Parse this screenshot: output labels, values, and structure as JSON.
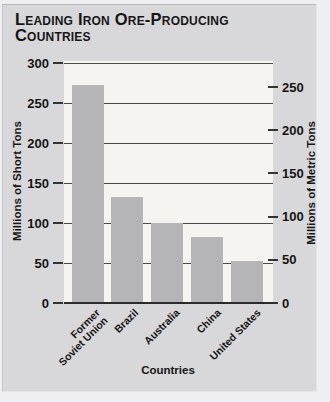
{
  "title": "Leading Iron Ore-Producing Countries",
  "chart_data": {
    "type": "bar",
    "title": "Leading Iron Ore-Producing Countries",
    "categories": [
      "Former\nSoviet Union",
      "Brazil",
      "Australia",
      "China",
      "United States"
    ],
    "values": [
      273,
      132,
      100,
      82,
      52
    ],
    "values_unit": "millions of short tons",
    "approx_metric_values": [
      248,
      120,
      91,
      74,
      47
    ],
    "xlabel": "Countries",
    "left_axis": {
      "label": "Millions of Short Tons",
      "ticks": [
        300,
        250,
        200,
        150,
        100,
        50,
        0
      ],
      "ylim": [
        0,
        300
      ]
    },
    "right_axis": {
      "label": "Millions of Metric Tons",
      "ticks": [
        250,
        200,
        150,
        100,
        50,
        0
      ],
      "ylim": [
        0,
        272
      ]
    },
    "grid": "horizontal gridlines every 50 short tons, drawn behind bars",
    "legend": "none",
    "colors": {
      "bar": "#b5b4b6",
      "plot_background": "#f5f4f1",
      "panel_background": "#d8d7d9",
      "outer_background": "#efeef3",
      "gridline": "#4a4a4a",
      "text": "#1a1a1a"
    }
  }
}
